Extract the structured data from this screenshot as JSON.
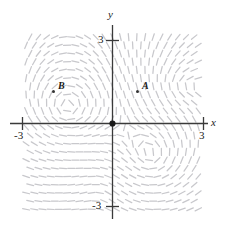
{
  "chart_data": {
    "type": "scatter",
    "title": "",
    "xlabel": "x",
    "ylabel": "y",
    "xlim": [
      -3.25,
      3.25
    ],
    "ylim": [
      -3.25,
      3.25
    ],
    "grid": false,
    "legend": null,
    "x_ticks": [
      -3,
      3
    ],
    "y_ticks": [
      -3,
      3
    ],
    "x_tick_labels": [
      "-3",
      "3"
    ],
    "y_tick_labels": [
      "-3",
      "3"
    ],
    "points": [
      {
        "label": "A",
        "x": 0.9,
        "y": 1.15
      },
      {
        "label": "B",
        "x": -2.1,
        "y": 1.15
      },
      {
        "label": "",
        "x": 0,
        "y": 0
      }
    ],
    "slope_field": {
      "description": "direction field of dashes forming vortices",
      "color": "#c8c8cc",
      "dash_length": 7,
      "grid_step": 8.2,
      "x_range": [
        -3.2,
        3.2
      ],
      "y_range": [
        -3.2,
        3.2
      ],
      "vortices": [
        {
          "x": -1.7,
          "y": 0.55,
          "strength": 1.0,
          "sense": 1
        },
        {
          "x": 1.45,
          "y": -1.25,
          "strength": 1.0,
          "sense": 1
        },
        {
          "x": -0.35,
          "y": -2.35,
          "strength": 0.45,
          "sense": -1
        },
        {
          "x": 2.45,
          "y": 1.35,
          "strength": 0.4,
          "sense": -1
        }
      ]
    }
  },
  "axis_labels": {
    "x": "x",
    "y": "y"
  },
  "tick_labels": {
    "y_top": "3",
    "y_bottom": "-3",
    "x_left": "-3",
    "x_right": "3"
  },
  "point_labels": {
    "a": "A",
    "b": "B"
  },
  "colors": {
    "axis": "#3a3a3a",
    "field": "#c9c9ce",
    "point": "#333333",
    "text": "#222222",
    "background": "#ffffff"
  }
}
